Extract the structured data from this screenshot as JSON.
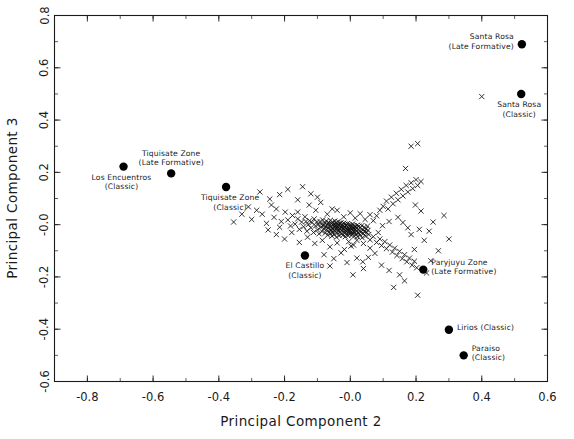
{
  "figure": {
    "width": 574,
    "height": 439,
    "background": "#ffffff",
    "foreground": "#1a1a1a"
  },
  "chart_data": {
    "type": "scatter",
    "title": "",
    "xlabel": "Principal Component 2",
    "ylabel": "Principal Component 3",
    "xlim": [
      -0.9,
      0.6
    ],
    "ylim": [
      -0.6,
      0.8
    ],
    "xticks": [
      -0.8,
      -0.6,
      -0.4,
      -0.2,
      -0.0,
      0.2,
      0.4,
      0.6
    ],
    "xticklabels": [
      "-0.8",
      "-0.6",
      "-0.4",
      "-0.2",
      "-0.0",
      "0.2",
      "0.4",
      "0.6"
    ],
    "yticks": [
      -0.6,
      -0.4,
      -0.2,
      -0.0,
      0.2,
      0.4,
      0.6,
      0.8
    ],
    "yticklabels": [
      "-0.6",
      "-0.4",
      "-0.2",
      "-0.0",
      "0.2",
      "0.4",
      "0.6",
      "0.8"
    ],
    "minor_ticks": true,
    "grid": false,
    "legend": "none",
    "series": [
      {
        "name": "samples",
        "marker": "x",
        "color": "#111111",
        "points": [
          [
            -0.285,
            0.055
          ],
          [
            -0.268,
            0.04
          ],
          [
            -0.3,
            0.02
          ],
          [
            -0.255,
            0.005
          ],
          [
            -0.24,
            0.075
          ],
          [
            -0.225,
            0.06
          ],
          [
            -0.232,
            0.028
          ],
          [
            -0.21,
            0.012
          ],
          [
            -0.215,
            -0.01
          ],
          [
            -0.198,
            0.048
          ],
          [
            -0.19,
            0.018
          ],
          [
            -0.182,
            -0.005
          ],
          [
            -0.176,
            0.035
          ],
          [
            -0.168,
            0.002
          ],
          [
            -0.16,
            0.022
          ],
          [
            -0.155,
            -0.018
          ],
          [
            -0.148,
            0.01
          ],
          [
            -0.142,
            -0.008
          ],
          [
            -0.138,
            0.03
          ],
          [
            -0.132,
            -0.025
          ],
          [
            -0.128,
            0.0
          ],
          [
            -0.124,
            0.015
          ],
          [
            -0.12,
            -0.012
          ],
          [
            -0.116,
            0.008
          ],
          [
            -0.112,
            -0.03
          ],
          [
            -0.11,
            0.022
          ],
          [
            -0.106,
            -0.005
          ],
          [
            -0.102,
            0.01
          ],
          [
            -0.1,
            -0.02
          ],
          [
            -0.098,
            0.0
          ],
          [
            -0.095,
            -0.035
          ],
          [
            -0.092,
            0.012
          ],
          [
            -0.09,
            -0.01
          ],
          [
            -0.088,
            0.002
          ],
          [
            -0.086,
            -0.026
          ],
          [
            -0.084,
            0.018
          ],
          [
            -0.082,
            -0.004
          ],
          [
            -0.08,
            -0.016
          ],
          [
            -0.078,
            0.006
          ],
          [
            -0.076,
            -0.032
          ],
          [
            -0.075,
            -0.008
          ],
          [
            -0.073,
            0.014
          ],
          [
            -0.072,
            -0.02
          ],
          [
            -0.07,
            0.0
          ],
          [
            -0.069,
            -0.04
          ],
          [
            -0.068,
            -0.012
          ],
          [
            -0.066,
            0.008
          ],
          [
            -0.065,
            -0.028
          ],
          [
            -0.064,
            -0.002
          ],
          [
            -0.062,
            -0.018
          ],
          [
            -0.061,
            0.016
          ],
          [
            -0.06,
            -0.034
          ],
          [
            -0.059,
            -0.006
          ],
          [
            -0.058,
            -0.022
          ],
          [
            -0.057,
            0.004
          ],
          [
            -0.056,
            -0.044
          ],
          [
            -0.055,
            -0.014
          ],
          [
            -0.054,
            0.01
          ],
          [
            -0.053,
            -0.03
          ],
          [
            -0.052,
            -0.002
          ],
          [
            -0.051,
            -0.02
          ],
          [
            -0.05,
            0.002
          ],
          [
            -0.049,
            -0.038
          ],
          [
            -0.048,
            -0.01
          ],
          [
            -0.047,
            0.014
          ],
          [
            -0.046,
            -0.026
          ],
          [
            -0.045,
            -0.004
          ],
          [
            -0.044,
            -0.018
          ],
          [
            -0.043,
            0.006
          ],
          [
            -0.042,
            -0.048
          ],
          [
            -0.041,
            -0.012
          ],
          [
            -0.04,
            0.0
          ],
          [
            -0.039,
            -0.032
          ],
          [
            -0.038,
            -0.008
          ],
          [
            -0.037,
            0.012
          ],
          [
            -0.036,
            -0.022
          ],
          [
            -0.035,
            -0.002
          ],
          [
            -0.034,
            -0.042
          ],
          [
            -0.033,
            -0.015
          ],
          [
            -0.032,
            0.004
          ],
          [
            -0.031,
            -0.028
          ],
          [
            -0.03,
            -0.006
          ],
          [
            -0.029,
            -0.019
          ],
          [
            -0.028,
            0.008
          ],
          [
            -0.027,
            -0.036
          ],
          [
            -0.026,
            -0.011
          ],
          [
            -0.025,
            0.0
          ],
          [
            -0.024,
            -0.024
          ],
          [
            -0.023,
            -0.005
          ],
          [
            -0.022,
            -0.04
          ],
          [
            -0.021,
            -0.015
          ],
          [
            -0.02,
            0.006
          ],
          [
            -0.019,
            -0.03
          ],
          [
            -0.018,
            -0.008
          ],
          [
            -0.017,
            -0.02
          ],
          [
            -0.016,
            0.002
          ],
          [
            -0.015,
            -0.046
          ],
          [
            -0.014,
            -0.012
          ],
          [
            -0.013,
            -0.026
          ],
          [
            -0.012,
            -0.003
          ],
          [
            -0.011,
            -0.034
          ],
          [
            -0.01,
            -0.016
          ],
          [
            -0.009,
            0.004
          ],
          [
            -0.008,
            -0.022
          ],
          [
            -0.007,
            -0.042
          ],
          [
            -0.006,
            -0.01
          ],
          [
            -0.005,
            -0.028
          ],
          [
            -0.004,
            0.0
          ],
          [
            -0.003,
            -0.018
          ],
          [
            -0.002,
            -0.036
          ],
          [
            -0.001,
            -0.008
          ],
          [
            0.0,
            -0.024
          ],
          [
            0.001,
            -0.002
          ],
          [
            0.002,
            -0.03
          ],
          [
            0.003,
            -0.014
          ],
          [
            0.004,
            -0.04
          ],
          [
            0.005,
            -0.006
          ],
          [
            0.006,
            -0.022
          ],
          [
            0.007,
            0.002
          ],
          [
            0.008,
            -0.033
          ],
          [
            0.009,
            -0.012
          ],
          [
            0.01,
            -0.026
          ],
          [
            0.011,
            -0.004
          ],
          [
            0.012,
            -0.044
          ],
          [
            0.013,
            -0.016
          ],
          [
            0.014,
            -0.03
          ],
          [
            0.015,
            -0.008
          ],
          [
            0.016,
            -0.02
          ],
          [
            0.018,
            -0.038
          ],
          [
            0.019,
            -0.012
          ],
          [
            0.02,
            -0.026
          ],
          [
            0.021,
            -0.002
          ],
          [
            0.022,
            -0.046
          ],
          [
            0.024,
            -0.018
          ],
          [
            0.025,
            -0.032
          ],
          [
            0.026,
            -0.006
          ],
          [
            0.028,
            -0.024
          ],
          [
            0.03,
            -0.04
          ],
          [
            0.031,
            -0.012
          ],
          [
            0.033,
            -0.028
          ],
          [
            0.035,
            -0.004
          ],
          [
            0.036,
            -0.05
          ],
          [
            0.038,
            -0.02
          ],
          [
            0.04,
            -0.034
          ],
          [
            0.042,
            -0.01
          ],
          [
            0.044,
            -0.026
          ],
          [
            0.046,
            -0.044
          ],
          [
            0.048,
            -0.016
          ],
          [
            0.05,
            -0.03
          ],
          [
            0.052,
            -0.006
          ],
          [
            0.054,
            -0.022
          ],
          [
            0.056,
            -0.038
          ],
          [
            -0.16,
            0.095
          ],
          [
            -0.125,
            0.075
          ],
          [
            -0.09,
            0.085
          ],
          [
            -0.055,
            0.06
          ],
          [
            -0.1,
            0.105
          ],
          [
            -0.07,
            0.04
          ],
          [
            -0.04,
            0.055
          ],
          [
            -0.02,
            0.03
          ],
          [
            0.0,
            0.045
          ],
          [
            0.015,
            0.025
          ],
          [
            0.03,
            0.042
          ],
          [
            0.045,
            0.02
          ],
          [
            0.06,
            0.038
          ],
          [
            0.07,
            0.015
          ],
          [
            0.08,
            0.034
          ],
          [
            0.09,
            0.055
          ],
          [
            0.1,
            0.07
          ],
          [
            0.11,
            0.09
          ],
          [
            0.115,
            0.06
          ],
          [
            0.125,
            0.105
          ],
          [
            0.13,
            0.08
          ],
          [
            0.14,
            0.12
          ],
          [
            0.145,
            0.095
          ],
          [
            0.155,
            0.135
          ],
          [
            0.16,
            0.11
          ],
          [
            0.17,
            0.15
          ],
          [
            0.175,
            0.125
          ],
          [
            0.185,
            0.16
          ],
          [
            0.19,
            0.138
          ],
          [
            0.2,
            0.172
          ],
          [
            0.205,
            0.15
          ],
          [
            0.215,
            0.165
          ],
          [
            0.06,
            -0.058
          ],
          [
            0.07,
            -0.046
          ],
          [
            0.08,
            -0.068
          ],
          [
            0.09,
            -0.055
          ],
          [
            0.095,
            -0.08
          ],
          [
            0.105,
            -0.065
          ],
          [
            0.11,
            -0.092
          ],
          [
            0.12,
            -0.078
          ],
          [
            0.128,
            -0.105
          ],
          [
            0.135,
            -0.09
          ],
          [
            0.142,
            -0.118
          ],
          [
            0.15,
            -0.102
          ],
          [
            0.158,
            -0.13
          ],
          [
            0.165,
            -0.115
          ],
          [
            0.172,
            -0.142
          ],
          [
            0.18,
            -0.128
          ],
          [
            0.188,
            -0.155
          ],
          [
            0.195,
            -0.14
          ],
          [
            0.202,
            -0.165
          ],
          [
            0.06,
            -0.09
          ],
          [
            0.04,
            -0.072
          ],
          [
            0.02,
            -0.06
          ],
          [
            0.01,
            -0.078
          ],
          [
            -0.005,
            -0.065
          ],
          [
            0.145,
            0.028
          ],
          [
            0.16,
            0.008
          ],
          [
            0.175,
            -0.012
          ],
          [
            0.185,
            -0.038
          ],
          [
            0.118,
            0.012
          ],
          [
            0.098,
            -0.004
          ],
          [
            0.085,
            -0.03
          ],
          [
            0.075,
            -0.11
          ],
          [
            0.055,
            -0.125
          ],
          [
            0.038,
            -0.142
          ],
          [
            0.095,
            -0.155
          ],
          [
            0.118,
            -0.175
          ],
          [
            0.15,
            -0.192
          ],
          [
            0.165,
            -0.215
          ],
          [
            0.132,
            -0.24
          ],
          [
            0.195,
            -0.095
          ],
          [
            0.225,
            -0.06
          ],
          [
            0.24,
            -0.025
          ],
          [
            0.21,
            -0.018
          ],
          [
            0.252,
            0.01
          ],
          [
            0.215,
            0.052
          ],
          [
            0.198,
            0.075
          ],
          [
            0.168,
            0.215
          ],
          [
            0.185,
            0.3
          ],
          [
            0.205,
            0.31
          ],
          [
            0.4,
            0.49
          ],
          [
            0.285,
            0.035
          ],
          [
            0.3,
            -0.055
          ],
          [
            0.268,
            -0.1
          ],
          [
            0.245,
            -0.138
          ],
          [
            0.232,
            -0.185
          ],
          [
            0.205,
            -0.27
          ],
          [
            -0.33,
            0.04
          ],
          [
            -0.31,
            0.068
          ],
          [
            -0.355,
            0.01
          ],
          [
            -0.215,
            0.115
          ],
          [
            -0.19,
            0.135
          ],
          [
            -0.245,
            0.098
          ],
          [
            -0.275,
            0.125
          ],
          [
            -0.145,
            0.145
          ],
          [
            -0.12,
            0.118
          ],
          [
            -0.16,
            0.048
          ],
          [
            -0.135,
            0.012
          ],
          [
            -0.105,
            0.055
          ],
          [
            -0.25,
            -0.02
          ],
          [
            -0.225,
            -0.038
          ],
          [
            -0.2,
            -0.055
          ],
          [
            -0.178,
            -0.03
          ],
          [
            -0.155,
            -0.068
          ],
          [
            -0.13,
            -0.048
          ],
          [
            -0.108,
            -0.072
          ],
          [
            -0.085,
            -0.06
          ],
          [
            -0.062,
            -0.085
          ],
          [
            -0.04,
            -0.07
          ],
          [
            -0.018,
            -0.095
          ],
          [
            0.002,
            -0.082
          ],
          [
            -0.08,
            -0.115
          ],
          [
            -0.05,
            -0.13
          ],
          [
            -0.028,
            -0.108
          ],
          [
            -0.01,
            -0.145
          ],
          [
            0.02,
            -0.128
          ],
          [
            0.04,
            -0.168
          ],
          [
            0.008,
            -0.192
          ],
          [
            -0.062,
            -0.158
          ]
        ]
      },
      {
        "name": "labeled-sites",
        "marker": "o",
        "color": "#000000",
        "points": [
          {
            "x": -0.69,
            "y": 0.222,
            "label": "Los Encuentros\n(Classic)",
            "anchor": "below-left"
          },
          {
            "x": -0.545,
            "y": 0.196,
            "label": "Tiquisate Zone\n(Late Formative)",
            "anchor": "above"
          },
          {
            "x": -0.378,
            "y": 0.144,
            "label": "Tiquisate Zone\n(Classic)",
            "anchor": "below-right"
          },
          {
            "x": -0.138,
            "y": -0.118,
            "label": "El Castillo\n(Classic)",
            "anchor": "below"
          },
          {
            "x": 0.222,
            "y": -0.172,
            "label": "Paryjuyu Zone\n(Late Formative)",
            "anchor": "right"
          },
          {
            "x": 0.3,
            "y": -0.402,
            "label": "Lirios (Classic)",
            "anchor": "right"
          },
          {
            "x": 0.345,
            "y": -0.5,
            "label": "Paraiso\n(Classic)",
            "anchor": "right"
          },
          {
            "x": 0.522,
            "y": 0.69,
            "label": "Santa Rosa\n(Late Formative)",
            "anchor": "left"
          },
          {
            "x": 0.52,
            "y": 0.5,
            "label": "Santa Rosa\n(Classic)",
            "anchor": "below-left"
          }
        ]
      }
    ]
  }
}
